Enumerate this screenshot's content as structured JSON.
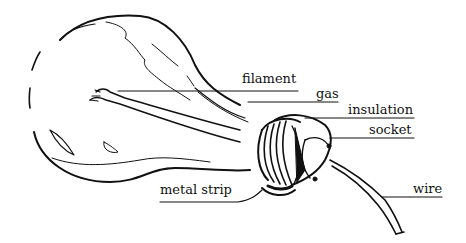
{
  "diagram": {
    "labels": {
      "filament": "filament",
      "gas": "gas",
      "insulation": "insulation",
      "socket": "socket",
      "metal_strip": "metal strip",
      "wire": "wire"
    },
    "colors": {
      "ink": "#111111",
      "background": "#ffffff"
    }
  }
}
